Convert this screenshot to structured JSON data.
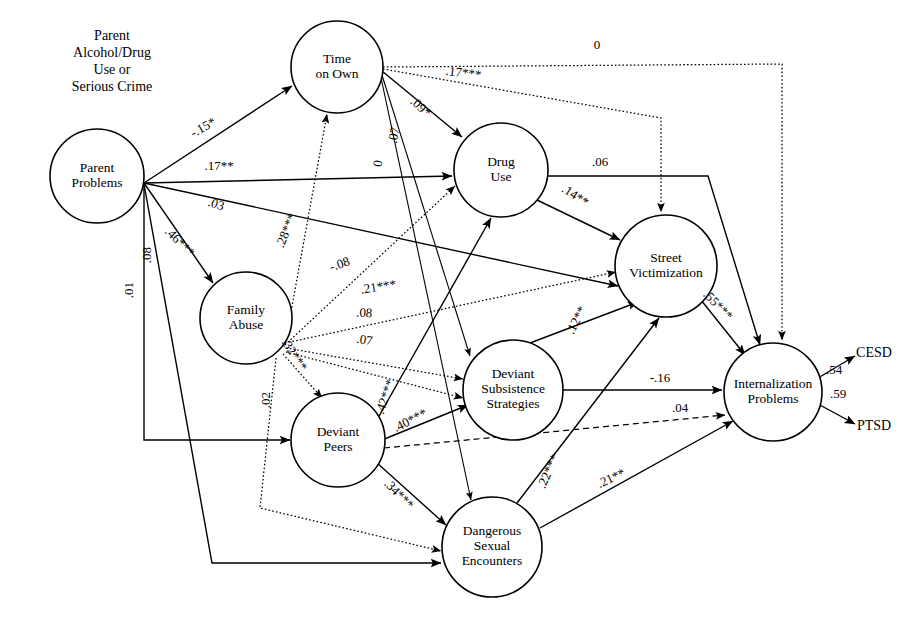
{
  "figure": {
    "type": "path-diagram",
    "external_labels": [
      {
        "id": "parent-source",
        "text_lines": [
          "Parent",
          "Alcohol/Drug",
          "Use or",
          "Serious Crime"
        ],
        "x": 112,
        "y": 40
      },
      {
        "id": "cesd",
        "text": "CESD",
        "x": 874,
        "y": 357
      },
      {
        "id": "ptsd",
        "text": "PTSD",
        "x": 874,
        "y": 430
      }
    ],
    "nodes": [
      {
        "id": "parent_problems",
        "label_lines": [
          "Parent",
          "Problems"
        ],
        "cx": 97,
        "cy": 176,
        "r": 47
      },
      {
        "id": "time_on_own",
        "label_lines": [
          "Time",
          "on Own"
        ],
        "cx": 337,
        "cy": 67,
        "r": 46
      },
      {
        "id": "drug_use",
        "label_lines": [
          "Drug",
          "Use"
        ],
        "cx": 501,
        "cy": 170,
        "r": 47
      },
      {
        "id": "family_abuse",
        "label_lines": [
          "Family",
          "Abuse"
        ],
        "cx": 246,
        "cy": 318,
        "r": 46
      },
      {
        "id": "street_victimization",
        "label_lines": [
          "Street",
          "Victimization"
        ],
        "cx": 666,
        "cy": 266,
        "r": 51
      },
      {
        "id": "deviant_peers",
        "label_lines": [
          "Deviant",
          "Peers"
        ],
        "cx": 338,
        "cy": 440,
        "r": 47
      },
      {
        "id": "deviant_subsistence",
        "label_lines": [
          "Deviant",
          "Subsistence",
          "Strategies"
        ],
        "cx": 513,
        "cy": 390,
        "r": 50
      },
      {
        "id": "dangerous_sexual",
        "label_lines": [
          "Dangerous",
          "Sexual",
          "Encounters"
        ],
        "cx": 492,
        "cy": 547,
        "r": 50
      },
      {
        "id": "internalization",
        "label_lines": [
          "Internalization",
          "Problems"
        ],
        "cx": 773,
        "cy": 392,
        "r": 49
      }
    ],
    "edges": [
      {
        "id": "pp-to-tow",
        "from": "parent_problems",
        "to": "time_on_own",
        "coefficient": "-.15*",
        "style": "solid",
        "label_x": 205,
        "label_y": 131,
        "label_rot": -29,
        "path": "M144,183 L292,86"
      },
      {
        "id": "pp-to-du",
        "from": "parent_problems",
        "to": "drug_use",
        "coefficient": ".17**",
        "style": "solid",
        "label_x": 219,
        "label_y": 170,
        "label_rot": 0,
        "path": "M144,183 L452,176"
      },
      {
        "id": "pp-to-sv",
        "from": "parent_problems",
        "to": "street_victimization",
        "coefficient": ".03",
        "style": "solid",
        "label_x": 215,
        "label_y": 208,
        "label_rot": 18,
        "path": "M144,183 L618,286"
      },
      {
        "id": "pp-to-fa",
        "from": "parent_problems",
        "to": "family_abuse",
        "coefficient": ".46***",
        "style": "solid",
        "label_x": 177,
        "label_y": 245,
        "label_rot": 45,
        "path": "M144,183 L213,283"
      },
      {
        "id": "pp-to-dp",
        "from": "parent_problems",
        "to": "deviant_peers",
        "coefficient": ".08",
        "style": "solid",
        "label_x": 151,
        "label_y": 255,
        "label_rot": -90,
        "path": "M144,184 L144,440 L290,440"
      },
      {
        "id": "pp-to-dse",
        "from": "parent_problems",
        "to": "dangerous_sexual",
        "coefficient": ".01",
        "style": "solid",
        "label_x": 133,
        "label_y": 290,
        "label_rot": -90,
        "path": "M144,184 L212,563 L441,563"
      },
      {
        "id": "fa-to-tow",
        "from": "family_abuse",
        "to": "time_on_own",
        "coefficient": ".28***",
        "style": "dotted",
        "label_x": 290,
        "label_y": 232,
        "label_rot": -68,
        "path": "M285,345 L327,114"
      },
      {
        "id": "fa-to-du",
        "from": "family_abuse",
        "to": "drug_use",
        "coefficient": "-.08",
        "style": "dotted",
        "label_x": 341,
        "label_y": 268,
        "label_rot": -19,
        "path": "M285,345 L455,186"
      },
      {
        "id": "fa-to-sv",
        "from": "family_abuse",
        "to": "street_victimization",
        "coefficient": ".21***",
        "style": "dotted",
        "label_x": 379,
        "label_y": 291,
        "label_rot": -9,
        "path": "M285,343 L616,272"
      },
      {
        "id": "fa-to-dss",
        "from": "family_abuse",
        "to": "deviant_subsistence",
        "coefficient": ".08",
        "style": "dotted",
        "label_x": 364,
        "label_y": 317,
        "label_rot": 3,
        "path": "M286,348 L463,379"
      },
      {
        "id": "fa-to-dss2",
        "from": "family_abuse",
        "to": "deviant_subsistence",
        "coefficient": ".07",
        "style": "dotted",
        "label_x": 364,
        "label_y": 344,
        "label_rot": 8,
        "path": "M286,352 L463,398"
      },
      {
        "id": "fa-to-dp",
        "from": "family_abuse",
        "to": "deviant_peers",
        "coefficient": ".32***",
        "style": "dotted",
        "label_x": 291,
        "label_y": 357,
        "label_rot": 57,
        "path": "M283,354 L322,398"
      },
      {
        "id": "fa-to-dse",
        "from": "family_abuse",
        "to": "dangerous_sexual",
        "coefficient": ".02",
        "style": "dotted",
        "label_x": 270,
        "label_y": 400,
        "label_rot": -90,
        "path": "M276,358 L260,508 L441,551"
      },
      {
        "id": "tow-to-int",
        "from": "time_on_own",
        "to": "internalization",
        "coefficient": "0",
        "style": "dotted",
        "label_x": 597,
        "label_y": 49,
        "label_rot": 0,
        "path": "M383,67 L782,64 L782,340"
      },
      {
        "id": "tow-to-sv",
        "from": "time_on_own",
        "to": "street_victimization",
        "coefficient": ".17***",
        "style": "dotted",
        "label_x": 463,
        "label_y": 77,
        "label_rot": 7,
        "path": "M383,69 L661,118 L661,212"
      },
      {
        "id": "tow-to-du",
        "from": "time_on_own",
        "to": "drug_use",
        "coefficient": ".09*",
        "style": "solid",
        "label_x": 418,
        "label_y": 110,
        "label_rot": 42,
        "path": "M382,71 L462,137"
      },
      {
        "id": "tow-to-dss",
        "from": "time_on_own",
        "to": "deviant_subsistence",
        "coefficient": ".07",
        "style": "thin",
        "label_x": 398,
        "label_y": 136,
        "label_rot": -79,
        "path": "M381,72 L470,356"
      },
      {
        "id": "tow-to-dse",
        "from": "time_on_own",
        "to": "dangerous_sexual",
        "coefficient": "0",
        "style": "thin",
        "label_x": 382,
        "label_y": 164,
        "label_rot": -82,
        "path": "M380,73 L471,500"
      },
      {
        "id": "du-to-int",
        "from": "drug_use",
        "to": "internalization",
        "coefficient": ".06",
        "style": "solid",
        "label_x": 600,
        "label_y": 166,
        "label_rot": 0,
        "path": "M547,176 L708,176 L760,345"
      },
      {
        "id": "du-to-sv",
        "from": "drug_use",
        "to": "street_victimization",
        "coefficient": ".14**",
        "style": "solid",
        "label_x": 573,
        "label_y": 199,
        "label_rot": 33,
        "path": "M537,200 L620,240"
      },
      {
        "id": "dp-to-du",
        "from": "deviant_peers",
        "to": "drug_use",
        "coefficient": ".42***",
        "style": "solid",
        "label_x": 389,
        "label_y": 398,
        "label_rot": -71,
        "path": "M374,425 L491,218"
      },
      {
        "id": "dp-to-dss",
        "from": "deviant_peers",
        "to": "deviant_subsistence",
        "coefficient": ".40***",
        "style": "solid",
        "label_x": 412,
        "label_y": 424,
        "label_rot": -27,
        "path": "M382,440 L468,405"
      },
      {
        "id": "dp-to-dse",
        "from": "deviant_peers",
        "to": "dangerous_sexual",
        "coefficient": ".34***",
        "style": "solid",
        "label_x": 396,
        "label_y": 497,
        "label_rot": 46,
        "path": "M376,462 L446,525"
      },
      {
        "id": "dp-to-int",
        "from": "deviant_peers",
        "to": "internalization",
        "coefficient": ".04",
        "style": "dashed",
        "label_x": 680,
        "label_y": 412,
        "label_rot": 0,
        "path": "M384,448 L725,415"
      },
      {
        "id": "dss-to-int",
        "from": "deviant_subsistence",
        "to": "internalization",
        "coefficient": "-.16",
        "style": "solid",
        "label_x": 660,
        "label_y": 382,
        "label_rot": 0,
        "path": "M563,390 L722,390"
      },
      {
        "id": "dss-to-sv",
        "from": "deviant_subsistence",
        "to": "street_victimization",
        "coefficient": ".12**",
        "style": "solid",
        "label_x": 580,
        "label_y": 322,
        "label_rot": -63,
        "path": "M530,343 L638,302"
      },
      {
        "id": "sv-to-int",
        "from": "street_victimization",
        "to": "internalization",
        "coefficient": ".55***",
        "style": "solid",
        "label_x": 715,
        "label_y": 308,
        "label_rot": 46,
        "path": "M701,300 L745,355"
      },
      {
        "id": "dse-to-sv",
        "from": "dangerous_sexual",
        "to": "street_victimization",
        "coefficient": ".22***",
        "style": "solid",
        "label_x": 552,
        "label_y": 473,
        "label_rot": -66,
        "path": "M517,503 L659,318"
      },
      {
        "id": "dse-to-int",
        "from": "dangerous_sexual",
        "to": "internalization",
        "coefficient": ".21**",
        "style": "solid",
        "label_x": 613,
        "label_y": 482,
        "label_rot": -25,
        "path": "M540,528 L733,421"
      },
      {
        "id": "int-to-cesd",
        "from": "internalization",
        "to": "cesd",
        "coefficient": ".54",
        "style": "solid",
        "label_x": 834,
        "label_y": 374,
        "label_rot": 0,
        "path": "M818,378 L855,356"
      },
      {
        "id": "int-to-ptsd",
        "from": "internalization",
        "to": "ptsd",
        "coefficient": ".59",
        "style": "solid",
        "label_x": 838,
        "label_y": 398,
        "label_rot": 0,
        "path": "M818,404 L855,424"
      }
    ]
  }
}
